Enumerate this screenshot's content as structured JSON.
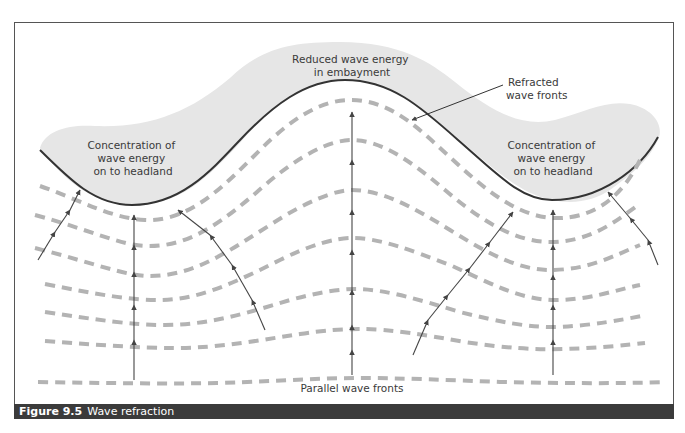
{
  "figure": {
    "number_label": "Figure 9.5",
    "title": "Wave refraction"
  },
  "labels": {
    "left_headland": [
      "Concentration of",
      "wave energy",
      "on to headland"
    ],
    "right_headland": [
      "Concentration of",
      "wave energy",
      "on to headland"
    ],
    "embayment": [
      "Reduced wave energy",
      "in embayment"
    ],
    "refracted": [
      "Refracted",
      "wave fronts"
    ],
    "parallel": "Parallel wave fronts"
  },
  "colors": {
    "land_fill": "#e6e6e6",
    "coastline": "#333333",
    "wave_front": "#b3b3b3",
    "arrow": "#444444",
    "caption_bar": "#3b3b3b",
    "frame": "#555555"
  }
}
